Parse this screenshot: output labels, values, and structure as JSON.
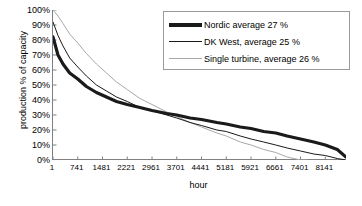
{
  "chart_data": {
    "type": "line",
    "title": "",
    "xlabel": "hour",
    "ylabel": "production % of capacity",
    "xlim": [
      1,
      8760
    ],
    "ylim": [
      0,
      100
    ],
    "grid": false,
    "legend_position": "top-right",
    "x_ticks": [
      "1",
      "741",
      "1481",
      "2221",
      "2961",
      "3701",
      "4441",
      "5181",
      "5921",
      "6661",
      "7401",
      "8141"
    ],
    "x_tick_values": [
      1,
      741,
      1481,
      2221,
      2961,
      3701,
      4441,
      5181,
      5921,
      6661,
      7401,
      8141
    ],
    "y_ticks": [
      "100%",
      "90%",
      "80%",
      "70%",
      "60%",
      "50%",
      "40%",
      "30%",
      "20%",
      "10%",
      "0%"
    ],
    "y_tick_values": [
      100,
      90,
      80,
      70,
      60,
      50,
      40,
      30,
      20,
      10,
      0
    ],
    "series": [
      {
        "name": "Nordic average 27 %",
        "color": "#1a1a1a",
        "width": 3.2,
        "average_percent": 27,
        "x": [
          1,
          150,
          300,
          500,
          741,
          1000,
          1300,
          1600,
          1900,
          2221,
          2600,
          2961,
          3400,
          3701,
          4100,
          4441,
          4900,
          5181,
          5600,
          5921,
          6300,
          6661,
          7000,
          7401,
          7800,
          8141,
          8500,
          8760
        ],
        "y": [
          82,
          70,
          64,
          58,
          54,
          49,
          45,
          42,
          39,
          37,
          35,
          33,
          31,
          30,
          28,
          27,
          25,
          24,
          22,
          21,
          19,
          18,
          16,
          14,
          12,
          10,
          7,
          2
        ]
      },
      {
        "name": "DK West, average 25 %",
        "color": "#1a1a1a",
        "width": 1,
        "average_percent": 25,
        "x": [
          1,
          150,
          300,
          500,
          741,
          1000,
          1300,
          1600,
          1900,
          2221,
          2600,
          2961,
          3400,
          3701,
          4100,
          4441,
          4900,
          5181,
          5600,
          5921,
          6300,
          6661,
          7000,
          7401,
          7800,
          8141,
          8500,
          8760
        ],
        "y": [
          92,
          83,
          76,
          68,
          62,
          56,
          50,
          46,
          42,
          39,
          35,
          33,
          30,
          28,
          25,
          23,
          20,
          19,
          16,
          14,
          12,
          10,
          8,
          6,
          4,
          3,
          1,
          0
        ]
      },
      {
        "name": "Single turbine, average 26 %",
        "color": "#a8a8a8",
        "width": 1,
        "average_percent": 26,
        "x": [
          1,
          150,
          300,
          500,
          741,
          1000,
          1300,
          1600,
          1900,
          2221,
          2600,
          2961,
          3400,
          3701,
          4100,
          4441,
          4900,
          5181,
          5600,
          5921,
          6300,
          6661,
          7000,
          7200,
          7401,
          7600
        ],
        "y": [
          100,
          96,
          91,
          84,
          78,
          71,
          64,
          58,
          52,
          47,
          41,
          37,
          32,
          29,
          25,
          22,
          18,
          16,
          12,
          10,
          7,
          5,
          2,
          1,
          0,
          0
        ]
      }
    ]
  },
  "axes": {
    "y_title": "production % of capacity",
    "x_title": "hour"
  },
  "legend": {
    "items": [
      {
        "label": "Nordic average 27 %",
        "swatch": "thick-black-line",
        "color": "#1a1a1a",
        "thickness": 4
      },
      {
        "label": "DK West, average 25 %",
        "swatch": "thin-black-line",
        "color": "#1a1a1a",
        "thickness": 1.5
      },
      {
        "label": "Single turbine, average 26 %",
        "swatch": "thin-gray-line",
        "color": "#a8a8a8",
        "thickness": 1.5
      }
    ]
  }
}
